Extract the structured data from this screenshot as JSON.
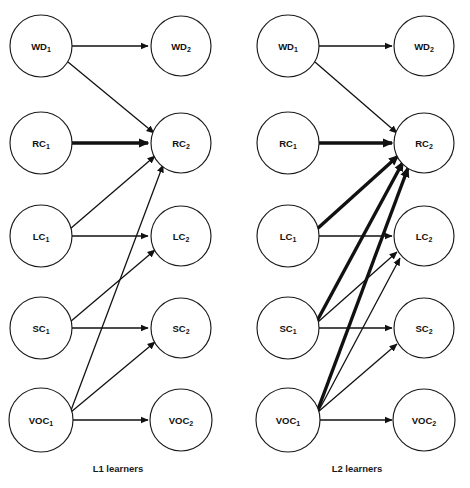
{
  "figure": {
    "type": "path-diagram",
    "background_color": "#ffffff",
    "stroke_color": "#111111",
    "node_fill": "#ffffff"
  },
  "panels": [
    {
      "id": "l1",
      "caption": "L1 learners",
      "caption_x": 118,
      "caption_y": 472,
      "origin_x": 0,
      "nodes": [
        {
          "id": "WD1",
          "base": "WD",
          "sub": "1",
          "cx": 41,
          "cy": 46,
          "r": 31
        },
        {
          "id": "WD2",
          "base": "WD",
          "sub": "2",
          "cx": 181,
          "cy": 46,
          "r": 30
        },
        {
          "id": "RC1",
          "base": "RC",
          "sub": "1",
          "cx": 41,
          "cy": 143,
          "r": 31
        },
        {
          "id": "RC2",
          "base": "RC",
          "sub": "2",
          "cx": 181,
          "cy": 143,
          "r": 30
        },
        {
          "id": "LC1",
          "base": "LC",
          "sub": "1",
          "cx": 41,
          "cy": 236,
          "r": 31
        },
        {
          "id": "LC2",
          "base": "LC",
          "sub": "2",
          "cx": 181,
          "cy": 236,
          "r": 30
        },
        {
          "id": "SC1",
          "base": "SC",
          "sub": "1",
          "cx": 41,
          "cy": 328,
          "r": 31
        },
        {
          "id": "SC2",
          "base": "SC",
          "sub": "2",
          "cx": 181,
          "cy": 328,
          "r": 30
        },
        {
          "id": "VOC1",
          "base": "VOC",
          "sub": "1",
          "cx": 41,
          "cy": 420,
          "r": 32
        },
        {
          "id": "VOC2",
          "base": "VOC",
          "sub": "2",
          "cx": 181,
          "cy": 420,
          "r": 31
        }
      ],
      "edges": [
        {
          "from": "WD1",
          "to": "WD2",
          "weight": "thin",
          "x1": 72,
          "y1": 46,
          "x2": 148,
          "y2": 46
        },
        {
          "from": "WD1",
          "to": "RC2",
          "weight": "thin",
          "x1": 68,
          "y1": 62,
          "x2": 154,
          "y2": 133
        },
        {
          "from": "RC1",
          "to": "RC2",
          "weight": "thick",
          "x1": 72,
          "y1": 143,
          "x2": 148,
          "y2": 143
        },
        {
          "from": "LC1",
          "to": "RC2",
          "weight": "thin",
          "x1": 70,
          "y1": 229,
          "x2": 155,
          "y2": 156
        },
        {
          "from": "LC1",
          "to": "LC2",
          "weight": "thin",
          "x1": 72,
          "y1": 236,
          "x2": 148,
          "y2": 236
        },
        {
          "from": "SC1",
          "to": "SC2",
          "weight": "thin",
          "x1": 72,
          "y1": 328,
          "x2": 148,
          "y2": 328
        },
        {
          "from": "SC1",
          "to": "LC2",
          "weight": "thin",
          "x1": 70,
          "y1": 322,
          "x2": 155,
          "y2": 250
        },
        {
          "from": "VOC1",
          "to": "RC2",
          "weight": "thin",
          "x1": 70,
          "y1": 413,
          "x2": 163,
          "y2": 165
        },
        {
          "from": "VOC1",
          "to": "SC2",
          "weight": "thin",
          "x1": 71,
          "y1": 412,
          "x2": 155,
          "y2": 342
        },
        {
          "from": "VOC1",
          "to": "VOC2",
          "weight": "thin",
          "x1": 73,
          "y1": 420,
          "x2": 148,
          "y2": 420
        }
      ]
    },
    {
      "id": "l2",
      "caption": "L2 learners",
      "caption_x": 357,
      "caption_y": 472,
      "origin_x": 235,
      "nodes": [
        {
          "id": "WD1",
          "base": "WD",
          "sub": "1",
          "cx": 288,
          "cy": 46,
          "r": 31
        },
        {
          "id": "WD2",
          "base": "WD",
          "sub": "2",
          "cx": 424,
          "cy": 46,
          "r": 30
        },
        {
          "id": "RC1",
          "base": "RC",
          "sub": "1",
          "cx": 288,
          "cy": 143,
          "r": 31
        },
        {
          "id": "RC2",
          "base": "RC",
          "sub": "2",
          "cx": 424,
          "cy": 143,
          "r": 30
        },
        {
          "id": "LC1",
          "base": "LC",
          "sub": "1",
          "cx": 288,
          "cy": 236,
          "r": 31
        },
        {
          "id": "LC2",
          "base": "LC",
          "sub": "2",
          "cx": 424,
          "cy": 236,
          "r": 30
        },
        {
          "id": "SC1",
          "base": "SC",
          "sub": "1",
          "cx": 288,
          "cy": 328,
          "r": 31
        },
        {
          "id": "SC2",
          "base": "SC",
          "sub": "2",
          "cx": 424,
          "cy": 328,
          "r": 30
        },
        {
          "id": "VOC1",
          "base": "VOC",
          "sub": "1",
          "cx": 288,
          "cy": 420,
          "r": 32
        },
        {
          "id": "VOC2",
          "base": "VOC",
          "sub": "2",
          "cx": 424,
          "cy": 420,
          "r": 31
        }
      ],
      "edges": [
        {
          "from": "WD1",
          "to": "WD2",
          "weight": "thin",
          "x1": 319,
          "y1": 46,
          "x2": 392,
          "y2": 46
        },
        {
          "from": "WD1",
          "to": "RC2",
          "weight": "thin",
          "x1": 315,
          "y1": 62,
          "x2": 397,
          "y2": 133
        },
        {
          "from": "RC1",
          "to": "RC2",
          "weight": "thick",
          "x1": 319,
          "y1": 143,
          "x2": 392,
          "y2": 143
        },
        {
          "from": "LC1",
          "to": "RC2",
          "weight": "thick",
          "x1": 317,
          "y1": 229,
          "x2": 398,
          "y2": 156
        },
        {
          "from": "LC1",
          "to": "LC2",
          "weight": "thin",
          "x1": 319,
          "y1": 236,
          "x2": 392,
          "y2": 236
        },
        {
          "from": "SC1",
          "to": "RC2",
          "weight": "thick",
          "x1": 317,
          "y1": 321,
          "x2": 403,
          "y2": 162
        },
        {
          "from": "SC1",
          "to": "LC2",
          "weight": "thin",
          "x1": 318,
          "y1": 322,
          "x2": 397,
          "y2": 252
        },
        {
          "from": "SC1",
          "to": "SC2",
          "weight": "thin",
          "x1": 319,
          "y1": 328,
          "x2": 392,
          "y2": 328
        },
        {
          "from": "VOC1",
          "to": "RC2",
          "weight": "thick",
          "x1": 317,
          "y1": 412,
          "x2": 408,
          "y2": 168
        },
        {
          "from": "VOC1",
          "to": "LC2",
          "weight": "thin",
          "x1": 318,
          "y1": 412,
          "x2": 400,
          "y2": 258
        },
        {
          "from": "VOC1",
          "to": "SC2",
          "weight": "thin",
          "x1": 318,
          "y1": 412,
          "x2": 397,
          "y2": 344
        },
        {
          "from": "VOC1",
          "to": "VOC2",
          "weight": "thin",
          "x1": 320,
          "y1": 420,
          "x2": 392,
          "y2": 420
        }
      ]
    }
  ]
}
